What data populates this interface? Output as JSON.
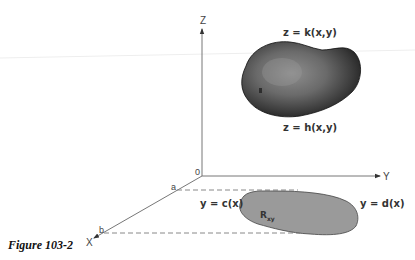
{
  "figure": {
    "caption": "Figure 103-2",
    "axes": {
      "z_label": "Z",
      "y_label": "Y",
      "x_label": "X",
      "origin_label": "0"
    },
    "ticks": {
      "a": "a",
      "b": "b"
    },
    "surfaces": {
      "upper": "z = k(x,y)",
      "lower": "z = h(x,y)"
    },
    "boundaries": {
      "left": "y = c(x)",
      "right": "y = d(x)"
    },
    "region": {
      "label_main": "R",
      "label_sub": "xy"
    },
    "colors": {
      "solid_dark": "#1e1e1e",
      "solid_mid": "#6a6a6a",
      "solid_light": "#8c8c8c",
      "region_fill": "#9a9a9a",
      "axis": "#777777",
      "dash": "#888888"
    }
  }
}
